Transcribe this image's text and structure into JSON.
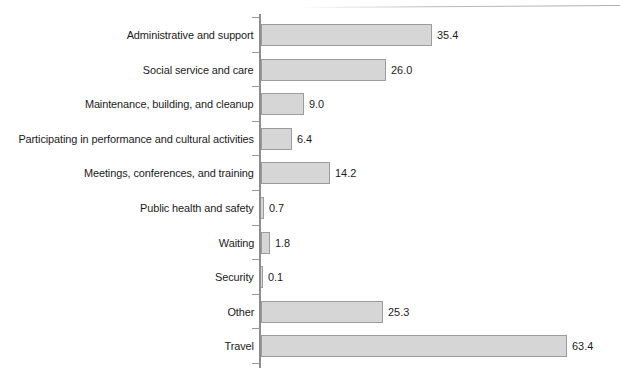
{
  "chart_data": {
    "type": "bar",
    "orientation": "horizontal",
    "title": "",
    "subtitle": "",
    "xlabel": "",
    "ylabel": "",
    "grid": false,
    "legend": null,
    "xlim": [
      0,
      63.4
    ],
    "categories": [
      "Administrative and support",
      "Social service and care",
      "Maintenance, building, and cleanup",
      "Participating in performance and cultural activities",
      "Meetings, conferences, and training",
      "Public health and safety",
      "Waiting",
      "Security",
      "Other",
      "Travel"
    ],
    "values": [
      35.4,
      26.0,
      9.0,
      6.4,
      14.2,
      0.7,
      1.8,
      0.1,
      25.3,
      63.4
    ],
    "value_labels": [
      "35.4",
      "26.0",
      "9.0",
      "6.4",
      "14.2",
      "0.7",
      "1.8",
      "0.1",
      "25.3",
      "63.4"
    ],
    "colors": {
      "bar_fill": "#d6d6d6",
      "bar_stroke": "#9c9c9c",
      "axis": "#8d8d8d",
      "text": "#1b1b1b",
      "background": "#ffffff"
    }
  }
}
